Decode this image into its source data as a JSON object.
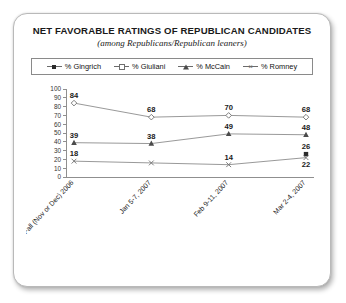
{
  "card": {
    "title": "NET FAVORABLE RATINGS OF REPUBLICAN CANDIDATES",
    "subtitle": "(among Republicans/Republican leaners)"
  },
  "legend": {
    "items": [
      {
        "label": "% Gingrich",
        "marker": "filled-square-marker",
        "color": "#2b2b2b"
      },
      {
        "label": "% Giuliani",
        "marker": "open-diamond-marker",
        "color": "#6f6f6f"
      },
      {
        "label": "% McCain",
        "marker": "filled-triangle-marker",
        "color": "#4a4a4a"
      },
      {
        "label": "% Romney",
        "marker": "x-cross-marker",
        "color": "#6f6f6f"
      }
    ]
  },
  "chart_data": {
    "type": "line",
    "title": "NET FAVORABLE RATINGS OF REPUBLICAN CANDIDATES",
    "subtitle": "(among Republicans/Republican leaners)",
    "xlabel": "",
    "ylabel": "",
    "ylim": [
      0,
      100
    ],
    "yticks": [
      0,
      10,
      20,
      30,
      40,
      50,
      60,
      70,
      80,
      90,
      100
    ],
    "ytick_labels": [
      "0",
      "10",
      "20",
      "30",
      "40",
      "50",
      "60",
      "70",
      "80",
      "90",
      "100"
    ],
    "grid": false,
    "legend_position": "top",
    "categories": [
      "Fall (Nov or Dec) 2006",
      "Jan 5-7, 2007",
      "Feb 9-11, 2007",
      "Mar 2-4, 2007"
    ],
    "series": [
      {
        "name": "% Gingrich",
        "marker": "filled-square-marker",
        "values": [
          null,
          null,
          null,
          26
        ],
        "labels": [
          "",
          "",
          "",
          "26"
        ]
      },
      {
        "name": "% Giuliani",
        "marker": "open-diamond-marker",
        "values": [
          84,
          68,
          70,
          68
        ],
        "labels": [
          "84",
          "68",
          "70",
          "68"
        ]
      },
      {
        "name": "% McCain",
        "marker": "filled-triangle-marker",
        "values": [
          39,
          38,
          49,
          48
        ],
        "labels": [
          "39",
          "38",
          "49",
          "48"
        ]
      },
      {
        "name": "% Romney",
        "marker": "x-cross-marker",
        "values": [
          18,
          16,
          14,
          22
        ],
        "labels": [
          "18",
          "",
          "14",
          "22"
        ]
      }
    ]
  }
}
